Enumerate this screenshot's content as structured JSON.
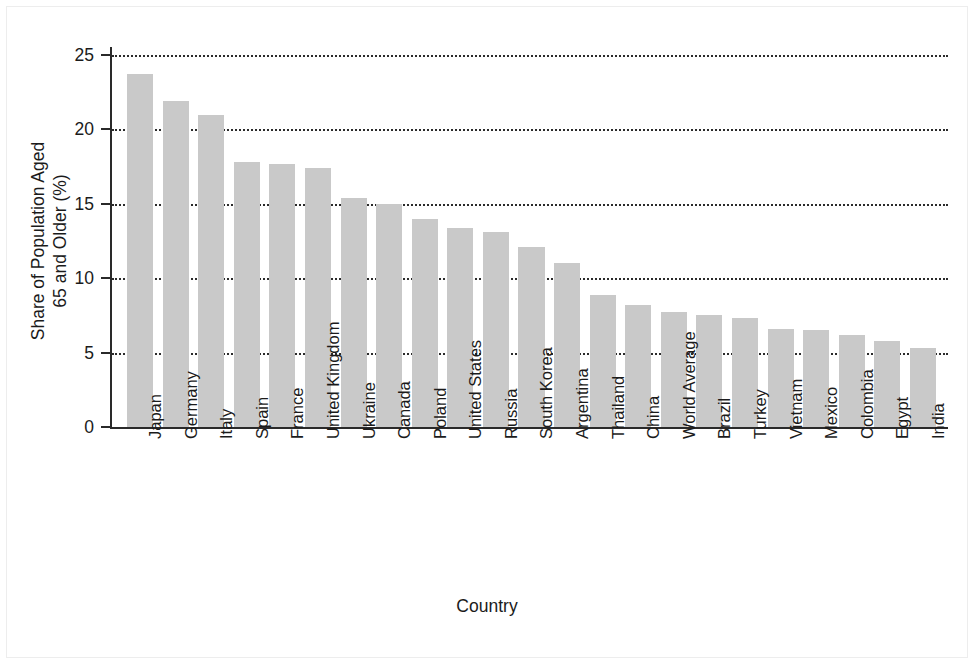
{
  "chart_data": {
    "type": "bar",
    "title": "",
    "xlabel": "Country",
    "ylabel": "Share of Population Aged 65 and Older (%)",
    "ylabel_lines": [
      "Share of Population Aged",
      "65 and Older (%)"
    ],
    "ylim": [
      0,
      25
    ],
    "yticks": [
      0,
      5,
      10,
      15,
      20,
      25
    ],
    "ytick_labels": [
      "0",
      "5",
      "10",
      "15",
      "20",
      "25"
    ],
    "grid": "horizontal-dotted",
    "legend": "none",
    "bar_color": "#c9c9c9",
    "axis_color": "#2a2a2a",
    "categories": [
      "Japan",
      "Germany",
      "Italy",
      "Spain",
      "France",
      "United Kingdom",
      "Ukraine",
      "Canada",
      "Poland",
      "United States",
      "Russia",
      "South Korea",
      "Argentina",
      "Thailand",
      "China",
      "World Average",
      "Brazil",
      "Turkey",
      "Vietnam",
      "Mexico",
      "Colombia",
      "Egypt",
      "India"
    ],
    "values": [
      23.7,
      21.9,
      21.0,
      17.8,
      17.7,
      17.4,
      15.4,
      15.0,
      14.0,
      13.4,
      13.1,
      12.1,
      11.0,
      8.9,
      8.2,
      7.7,
      7.5,
      7.3,
      6.6,
      6.5,
      6.2,
      5.8,
      5.3
    ]
  }
}
